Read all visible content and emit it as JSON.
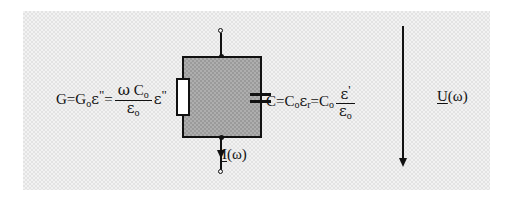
{
  "figure": {
    "background_color": "#f2f2f2",
    "device_fill_color": "#aeaeae",
    "line_color": "#111111"
  },
  "left_formula": {
    "name": "conductance-equation",
    "lhs": "G=G",
    "lhs_sub": "o",
    "lhs_eps": "ε",
    "lhs_prime": "\"",
    "equals": "=",
    "numerator_omega": "ω",
    "numerator_c": "C",
    "numerator_c_sub": "o",
    "denominator_eps": "ε",
    "denominator_sub": "o",
    "trailing_eps": "ε",
    "trailing_prime": "\""
  },
  "right_formula": {
    "name": "capacitance-equation",
    "lead": "C=C",
    "lead_sub": "o",
    "eps_r": "ε",
    "eps_r_sub": "r",
    "equals": "=C",
    "equals_sub": "o",
    "numerator_eps": "ε",
    "numerator_prime": "'",
    "denominator_eps": "ε",
    "denominator_sub": "o"
  },
  "current_label": {
    "name": "current-phasor-label",
    "symbol": "I",
    "argument": "(ω)"
  },
  "voltage_label": {
    "name": "voltage-phasor-label",
    "symbol": "U",
    "argument": "(ω)"
  },
  "components": {
    "resistor": "resistor-element",
    "capacitor": "capacitor-element",
    "device_box": "dielectric-sample-box",
    "top_terminal": "top-terminal-node",
    "bottom_terminal": "bottom-terminal-node",
    "current_arrow": "current-direction-arrow",
    "voltage_arrow": "voltage-direction-arrow"
  }
}
